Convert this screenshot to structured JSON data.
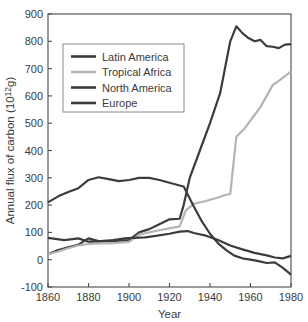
{
  "chart_data": {
    "type": "line",
    "title": "",
    "xlabel": "Year",
    "ylabel": "Annual flux of carbon (10¹²g)",
    "xlim": [
      1860,
      1980
    ],
    "ylim": [
      -100,
      900
    ],
    "xticks": [
      1860,
      1880,
      1900,
      1920,
      1940,
      1960,
      1980
    ],
    "xticklabels": [
      "1860",
      "1880",
      "1900",
      "1920",
      "1940",
      "1960",
      "1980"
    ],
    "yticks": [
      -100,
      0,
      100,
      200,
      300,
      400,
      500,
      600,
      700,
      800,
      900
    ],
    "yticklabels": [
      "-100",
      "0",
      "100",
      "200",
      "300",
      "400",
      "500",
      "600",
      "700",
      "800",
      "900"
    ],
    "grid": false,
    "legend_position": "upper-left",
    "series": [
      {
        "name": "Latin America",
        "color": "#3c3c3c",
        "x": [
          1860,
          1865,
          1870,
          1875,
          1880,
          1885,
          1890,
          1895,
          1900,
          1905,
          1910,
          1915,
          1920,
          1925,
          1927,
          1930,
          1935,
          1940,
          1945,
          1950,
          1953,
          1956,
          1959,
          1962,
          1965,
          1968,
          1971,
          1974,
          1977,
          1980
        ],
        "y": [
          20,
          35,
          45,
          55,
          78,
          68,
          68,
          70,
          72,
          100,
          112,
          130,
          148,
          150,
          200,
          300,
          400,
          500,
          610,
          800,
          855,
          830,
          812,
          800,
          805,
          782,
          780,
          775,
          788,
          790
        ]
      },
      {
        "name": "Tropical Africa",
        "color": "#b4b4b4",
        "x": [
          1860,
          1865,
          1870,
          1875,
          1880,
          1885,
          1890,
          1895,
          1900,
          1905,
          1910,
          1915,
          1920,
          1925,
          1928,
          1932,
          1938,
          1944,
          1948,
          1950,
          1953,
          1957,
          1961,
          1965,
          1968,
          1971,
          1974,
          1977,
          1980
        ],
        "y": [
          20,
          30,
          42,
          52,
          58,
          60,
          60,
          62,
          65,
          92,
          100,
          108,
          115,
          122,
          180,
          205,
          215,
          228,
          238,
          240,
          450,
          480,
          520,
          560,
          600,
          640,
          655,
          672,
          690
        ]
      },
      {
        "name": "North America",
        "color": "#3c3c3c",
        "x": [
          1860,
          1865,
          1870,
          1875,
          1880,
          1885,
          1890,
          1895,
          1900,
          1905,
          1910,
          1915,
          1920,
          1925,
          1927,
          1932,
          1936,
          1940,
          1944,
          1948,
          1952,
          1956,
          1960,
          1964,
          1968,
          1972,
          1976,
          1980
        ],
        "y": [
          210,
          232,
          248,
          262,
          292,
          302,
          295,
          288,
          292,
          300,
          300,
          292,
          282,
          272,
          268,
          195,
          140,
          95,
          60,
          35,
          15,
          5,
          0,
          -5,
          -12,
          -10,
          -30,
          -55
        ]
      },
      {
        "name": "Europe",
        "color": "#3c3c3c",
        "x": [
          1860,
          1868,
          1875,
          1880,
          1886,
          1892,
          1898,
          1902,
          1908,
          1914,
          1920,
          1925,
          1929,
          1932,
          1938,
          1944,
          1950,
          1956,
          1962,
          1968,
          1972,
          1976,
          1980
        ],
        "y": [
          80,
          72,
          78,
          66,
          68,
          72,
          78,
          80,
          82,
          88,
          95,
          103,
          105,
          98,
          88,
          72,
          52,
          38,
          25,
          16,
          8,
          5,
          14
        ]
      }
    ]
  },
  "legend": {
    "entries": [
      {
        "label": "Latin America"
      },
      {
        "label": "Tropical Africa"
      },
      {
        "label": "North America"
      },
      {
        "label": "Europe"
      }
    ]
  }
}
